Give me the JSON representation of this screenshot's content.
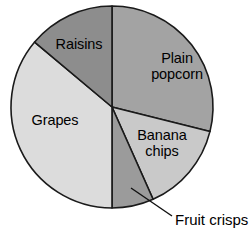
{
  "chart_data": {
    "type": "pie",
    "title": "",
    "subtitle": "",
    "xlabel": "",
    "ylabel": "",
    "legend_position": "none",
    "grid": false,
    "labels_on_slices": true,
    "start_angle_deg": 0,
    "direction": "clockwise",
    "categories": [
      "Plain popcorn",
      "Banana chips",
      "Fruit crisps",
      "Grapes",
      "Raisins"
    ],
    "values": [
      29,
      14,
      7,
      36,
      14
    ],
    "units": "percent",
    "slices": [
      {
        "name": "plain-popcorn",
        "label": "Plain\npopcorn",
        "start_deg": 0,
        "end_deg": 104,
        "value": 29,
        "color": "#a3a3a3",
        "callout": false
      },
      {
        "name": "banana-chips",
        "label": "Banana\nchips",
        "start_deg": 104,
        "end_deg": 156,
        "value": 14,
        "color": "#c9c9c9",
        "callout": false
      },
      {
        "name": "fruit-crisps",
        "label": "Fruit crisps",
        "start_deg": 156,
        "end_deg": 180,
        "value": 7,
        "color": "#9b9b9b",
        "callout": true
      },
      {
        "name": "grapes",
        "label": "Grapes",
        "start_deg": 180,
        "end_deg": 310,
        "value": 36,
        "color": "#dcdcdc",
        "callout": false
      },
      {
        "name": "raisins",
        "label": "Raisins",
        "start_deg": 310,
        "end_deg": 360,
        "value": 14,
        "color": "#8d8d8d",
        "callout": false
      }
    ],
    "geometry": {
      "center_x": 112,
      "center_y": 107,
      "radius": 101
    },
    "callout": {
      "text": "Fruit crisps",
      "from_x": 131,
      "from_y": 188,
      "to_x": 172,
      "to_y": 216
    },
    "colors": {
      "plain_popcorn": "#a3a3a3",
      "banana_chips": "#c9c9c9",
      "fruit_crisps": "#9b9b9b",
      "grapes": "#dcdcdc",
      "raisins": "#8d8d8d",
      "outline": "#1a1a1a",
      "background": "#ffffff",
      "text": "#000000"
    }
  }
}
